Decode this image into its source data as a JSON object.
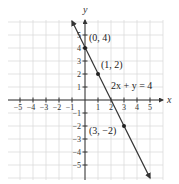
{
  "figure": {
    "x_axis_label": "x",
    "y_axis_label": "y",
    "x_ticks": [
      -5,
      -4,
      -3,
      -2,
      -1,
      1,
      2,
      3,
      4,
      5
    ],
    "y_ticks": [
      5,
      4,
      3,
      2,
      1,
      -1,
      -2,
      -3,
      -4,
      -5
    ],
    "equation_label": "2x + y = 4",
    "points": [
      {
        "x": 0,
        "y": 4,
        "label": "(0, 4)"
      },
      {
        "x": 1,
        "y": 2,
        "label": "(1, 2)"
      },
      {
        "x": 3,
        "y": -2,
        "label": "(3, −2)"
      }
    ],
    "line_color": "#333333",
    "grid_color": "#dcdcdc"
  }
}
